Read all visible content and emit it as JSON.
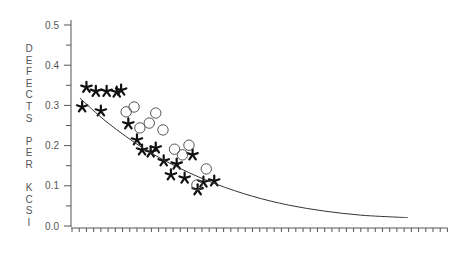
{
  "chart_data": {
    "type": "scatter",
    "title": "",
    "xlabel": "",
    "ylabel": "DEFECTS PER KCSI",
    "ylabel_lines": [
      "D",
      "E",
      "F",
      "E",
      "C",
      "T",
      "S",
      "",
      "P",
      "E",
      "R",
      "",
      "K",
      "C",
      "S",
      "I"
    ],
    "ylim": [
      0.0,
      0.5
    ],
    "yticks": [
      "0.0",
      "0.1",
      "0.2",
      "0.3",
      "0.4",
      "0.5"
    ],
    "xlim": [
      0,
      52
    ],
    "x_tick_count": 52,
    "x_tick_labels": [],
    "grid": false,
    "legend": null,
    "series": [
      {
        "name": "stars",
        "marker": "star",
        "points": [
          [
            2.0,
            0.345
          ],
          [
            3.3,
            0.335
          ],
          [
            4.8,
            0.335
          ],
          [
            6.2,
            0.333
          ],
          [
            6.8,
            0.338
          ],
          [
            1.4,
            0.296
          ],
          [
            4.0,
            0.286
          ],
          [
            7.8,
            0.254
          ],
          [
            9.0,
            0.214
          ],
          [
            9.7,
            0.189
          ],
          [
            11.6,
            0.194
          ],
          [
            10.9,
            0.184
          ],
          [
            12.7,
            0.162
          ],
          [
            14.5,
            0.154
          ],
          [
            13.7,
            0.127
          ],
          [
            15.6,
            0.119
          ],
          [
            16.7,
            0.177
          ],
          [
            18.2,
            0.109
          ],
          [
            19.7,
            0.112
          ],
          [
            17.4,
            0.09
          ]
        ]
      },
      {
        "name": "circles",
        "marker": "circle-open",
        "points": [
          [
            7.5,
            0.284
          ],
          [
            8.6,
            0.296
          ],
          [
            9.4,
            0.244
          ],
          [
            10.7,
            0.256
          ],
          [
            11.6,
            0.281
          ],
          [
            12.6,
            0.239
          ],
          [
            14.2,
            0.191
          ],
          [
            15.3,
            0.177
          ],
          [
            16.2,
            0.201
          ],
          [
            18.6,
            0.142
          ],
          [
            17.3,
            0.102
          ]
        ]
      },
      {
        "name": "fitted-curve",
        "marker": "line",
        "points": [
          [
            1.1,
            0.318
          ],
          [
            5,
            0.256
          ],
          [
            10,
            0.192
          ],
          [
            15,
            0.143
          ],
          [
            20,
            0.104
          ],
          [
            25,
            0.074
          ],
          [
            30,
            0.052
          ],
          [
            35,
            0.037
          ],
          [
            40,
            0.027
          ],
          [
            45,
            0.022
          ],
          [
            46.5,
            0.021
          ]
        ]
      }
    ]
  }
}
